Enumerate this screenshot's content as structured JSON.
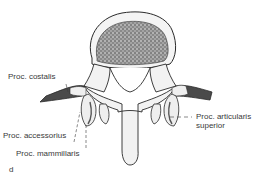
{
  "figure": {
    "panel_letter": "d",
    "labels": [
      {
        "id": "costalis",
        "text": "Proc. costalis"
      },
      {
        "id": "accessorius",
        "text": "Proc. accessorius"
      },
      {
        "id": "mammillaris",
        "text": "Proc. mammillaris"
      },
      {
        "id": "articularis_superior_1",
        "text": "Proc. articularis"
      },
      {
        "id": "articularis_superior_2",
        "text": "superior"
      }
    ],
    "colors": {
      "line": "#2a2a2a",
      "bone_fill": "#f3f3f3",
      "cancellous": "#6e6e6e",
      "costal_process": "#4a4a4a",
      "label_text": "#3a3a3a"
    }
  }
}
